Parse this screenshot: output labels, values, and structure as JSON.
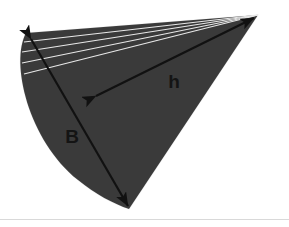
{
  "figure": {
    "background_color": "#ffffff",
    "sector": {
      "fill_color": "#3a3a3a",
      "apex": {
        "x": 258,
        "y": 15
      },
      "arc_top_end": {
        "x": 26,
        "y": 33
      },
      "arc_bottom_end": {
        "x": 129,
        "y": 209
      },
      "path": "M 258 15 L 26 33 C 10 62 28 140 78 180 C 95 194 114 204 129 209 Z"
    },
    "fan_lines": {
      "color": "#e8e8e8",
      "count": 4,
      "stroke_width": 1.1,
      "endpoints": [
        {
          "x": 24,
          "y": 42
        },
        {
          "x": 22,
          "y": 52
        },
        {
          "x": 22,
          "y": 63
        },
        {
          "x": 24,
          "y": 74
        }
      ]
    },
    "arrows": {
      "color": "#111111",
      "stroke_width": 2.2,
      "items": [
        {
          "name": "slant-height-arrow",
          "label": "h",
          "label_x": 174,
          "label_y": 88,
          "from": {
            "x": 96,
            "y": 96
          },
          "to": {
            "x": 254,
            "y": 18
          },
          "double_headed": true
        },
        {
          "name": "arc-length-arrow",
          "label": "B",
          "label_x": 72,
          "label_y": 143,
          "from": {
            "x": 31,
            "y": 39
          },
          "to": {
            "x": 128,
            "y": 206
          },
          "double_headed": true
        }
      ]
    },
    "footer_rule": {
      "color": "#d9d9d9",
      "y": 219
    }
  },
  "labels": {
    "slant_height": "h",
    "base_arc": "B"
  }
}
